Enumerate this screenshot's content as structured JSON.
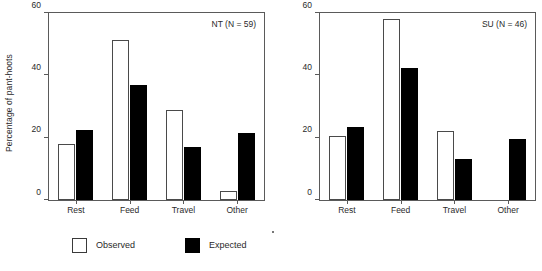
{
  "chart_data": {
    "type": "bar",
    "title": "",
    "xlabel": "",
    "ylabel": "Percentage of pant-hoots",
    "ylim": [
      0,
      60
    ],
    "yticks": [
      0,
      20,
      40,
      60
    ],
    "grid": false,
    "legend_position": "bottom-left",
    "categories": [
      "Rest",
      "Feed",
      "Travel",
      "Other"
    ],
    "panels": [
      {
        "tag": "NT (N = 59)",
        "group": "NT",
        "n": 59,
        "series": [
          {
            "name": "Observed",
            "color": "#ffffff",
            "values": [
              18.0,
              51.5,
              29.0,
              3.0
            ]
          },
          {
            "name": "Expected",
            "color": "#000000",
            "values": [
              22.5,
              37.0,
              17.0,
              21.5
            ]
          }
        ]
      },
      {
        "tag": "SU (N = 46)",
        "group": "SU",
        "n": 46,
        "series": [
          {
            "name": "Observed",
            "color": "#ffffff",
            "values": [
              20.5,
              58.0,
              22.0,
              0.0
            ]
          },
          {
            "name": "Expected",
            "color": "#000000",
            "values": [
              23.5,
              42.5,
              13.0,
              19.5
            ]
          }
        ]
      }
    ],
    "legend": [
      {
        "label": "Observed",
        "swatch": "white-square-outlined"
      },
      {
        "label": "Expected",
        "swatch": "black-square-filled"
      }
    ]
  },
  "axis": {
    "ylabel": "Percentage of pant-hoots",
    "tick_labels": [
      "60",
      "40",
      "20",
      "0"
    ],
    "category_labels": [
      "Rest",
      "Feed",
      "Travel",
      "Other"
    ]
  },
  "panel_tags": {
    "left": "NT (N = 59)",
    "right": "SU (N = 46)"
  },
  "legend": {
    "observed_label": "Observed",
    "expected_label": "Expected"
  },
  "colors": {
    "observed": "#ffffff",
    "expected": "#000000",
    "axis": "#5a5a5a",
    "text": "#2a2a2a",
    "background": "#ffffff"
  }
}
